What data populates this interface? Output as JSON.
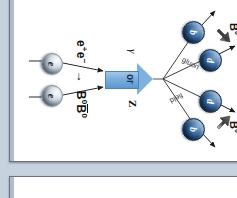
{
  "viewer": {
    "background_color": "#c6d2dd",
    "page_background": "#ffffff",
    "page_border_color": "#6a747e"
  },
  "figure": {
    "name": "e+e- to B0 B0bar production diagram",
    "reaction": {
      "initial_e_plus": "e",
      "initial_e_plus_sup": "+",
      "initial_e_minus": "e",
      "initial_e_minus_sup": "−",
      "arrow": "→",
      "product_1": "B",
      "product_1_sup": "0",
      "product_2": "B",
      "product_2_sup": "0"
    },
    "boson": {
      "left_label": "γ",
      "middle_label": "or",
      "right_label": "Z",
      "color": "#7fb0de"
    },
    "field_labels": {
      "gluon": "gluon",
      "field": "field"
    },
    "meson_labels": {
      "left": "B",
      "left_sup": "0",
      "right": "B",
      "right_sup": "0"
    },
    "particles": [
      {
        "id": "lepton-left",
        "label": "e",
        "kind": "lepton"
      },
      {
        "id": "lepton-right",
        "label": "e",
        "kind": "lepton"
      },
      {
        "id": "quark-b-left",
        "label": "b",
        "kind": "quark"
      },
      {
        "id": "quark-d-left",
        "label": "d",
        "kind": "quark"
      },
      {
        "id": "quark-d-right",
        "label": "d",
        "kind": "quark"
      },
      {
        "id": "quark-b-right",
        "label": "b",
        "kind": "quark"
      }
    ],
    "colors": {
      "quark_fill": "#3c6fa6",
      "lepton_fill": "#cfd9e4",
      "boson_fill": "#7fb0de",
      "meson_arrow": "#4a4a4a"
    }
  }
}
